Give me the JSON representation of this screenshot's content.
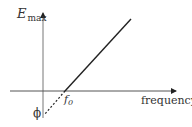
{
  "diagram": {
    "y_axis_label": "E",
    "y_axis_subscript": "max",
    "x_axis_label": "frequency",
    "threshold_label": "f",
    "threshold_subscript": "0",
    "intercept_label": "ϕ",
    "colors": {
      "axis": "#555555",
      "line": "#222222",
      "text": "#333333"
    }
  }
}
